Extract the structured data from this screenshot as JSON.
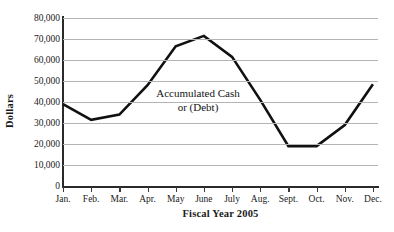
{
  "chart_data": {
    "type": "line",
    "title": "",
    "subtitle": "",
    "xlabel": "Fiscal Year 2005",
    "ylabel": "Dollars",
    "categories": [
      "Jan.",
      "Feb.",
      "Mar.",
      "Apr.",
      "May",
      "June",
      "July",
      "Aug.",
      "Sept.",
      "Oct.",
      "Nov.",
      "Dec."
    ],
    "series": [
      {
        "name": "Accumulated Cash or (Debt)",
        "values": [
          39000,
          31500,
          34000,
          48000,
          66500,
          71500,
          61500,
          41000,
          19000,
          19000,
          29000,
          48500
        ]
      }
    ],
    "ylim": [
      0,
      80000
    ],
    "y_ticks": [
      0,
      10000,
      20000,
      30000,
      40000,
      50000,
      60000,
      70000,
      80000
    ],
    "y_tick_labels": [
      "0",
      "10,000",
      "20,000",
      "30,000",
      "40,000",
      "50,000",
      "60,000",
      "70,000",
      "80,000"
    ],
    "grid": true,
    "legend": "none",
    "annotations": [
      {
        "name": "series-annotation",
        "lines": [
          "Accumulated Cash",
          "or (Debt)"
        ]
      }
    ],
    "colors": {
      "line": "#111111",
      "gridline": "#b4b4b4",
      "axis": "#2a2a2a",
      "background": "#ffffff",
      "text": "#1a1a1a"
    },
    "line_width_px": 2.6
  },
  "annotation_line_1": "Accumulated Cash",
  "annotation_line_2": "or (Debt)"
}
